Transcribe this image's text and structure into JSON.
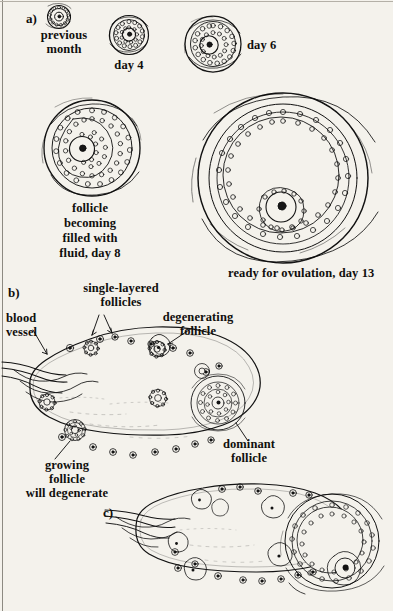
{
  "figure": {
    "background_color": "#f4f2ec",
    "ink_color": "#121212"
  },
  "panels": [
    {
      "id": "a",
      "tag": "a)"
    },
    {
      "id": "b",
      "tag": "b)"
    },
    {
      "id": "c",
      "tag": "c)"
    }
  ],
  "panel_a": {
    "tag": "a)",
    "stages": [
      {
        "name": "primordial-follicle",
        "caption_line1": "previous",
        "caption_line2": "month"
      },
      {
        "name": "primary-follicle",
        "caption_line1": "day 4",
        "caption_line2": ""
      },
      {
        "name": "secondary-follicle",
        "caption_line1": "day 6",
        "caption_line2": ""
      },
      {
        "name": "antral-follicle",
        "caption_line1": "follicle",
        "caption_line2": "becoming",
        "caption_line3": "filled with",
        "caption_line4": "fluid, day 8"
      },
      {
        "name": "graafian-follicle",
        "caption_line1": "ready for ovulation, day 13",
        "caption_line2": ""
      }
    ],
    "captions": {
      "previous_month": "previous\nmonth",
      "day4": "day 4",
      "day6": "day 6",
      "day8": "follicle\nbecoming\nfilled with\nfluid, day 8",
      "day13": "ready for ovulation, day 13"
    }
  },
  "panel_b": {
    "tag": "b)",
    "labels": {
      "single_layered": "single-layered\nfollicles",
      "blood_vessel": "blood\nvessel",
      "degenerating": "degenerating\nfollicle",
      "dominant": "dominant\nfollicle",
      "growing": "growing\nfollicle\nwill degenerate"
    }
  },
  "panel_c": {
    "tag": "c)",
    "labels": {}
  }
}
